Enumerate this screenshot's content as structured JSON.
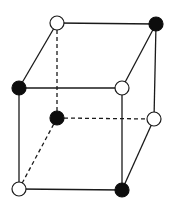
{
  "diagram": {
    "type": "cube-lattice",
    "colors": {
      "filled": "#0d0d0d",
      "open": "#ffffff",
      "line": "#1a1a1a",
      "background": "#ffffff"
    },
    "vertices": [
      {
        "id": "back-top-left",
        "x": 57,
        "y": 23,
        "kind": "open"
      },
      {
        "id": "back-top-right",
        "x": 156,
        "y": 24,
        "kind": "filled"
      },
      {
        "id": "front-top-left",
        "x": 19,
        "y": 88,
        "kind": "filled"
      },
      {
        "id": "front-top-right",
        "x": 122,
        "y": 88,
        "kind": "open"
      },
      {
        "id": "back-bottom-left",
        "x": 57,
        "y": 118,
        "kind": "filled"
      },
      {
        "id": "back-bottom-right",
        "x": 154,
        "y": 119,
        "kind": "open"
      },
      {
        "id": "front-bottom-left",
        "x": 19,
        "y": 189,
        "kind": "open"
      },
      {
        "id": "front-bottom-right",
        "x": 122,
        "y": 190,
        "kind": "filled"
      }
    ],
    "edges": [
      {
        "from": "back-top-left",
        "to": "back-top-right",
        "style": "solid"
      },
      {
        "from": "back-top-left",
        "to": "front-top-left",
        "style": "solid"
      },
      {
        "from": "back-top-right",
        "to": "front-top-right",
        "style": "solid"
      },
      {
        "from": "back-top-right",
        "to": "back-bottom-right",
        "style": "solid"
      },
      {
        "from": "front-top-left",
        "to": "front-top-right",
        "style": "solid"
      },
      {
        "from": "front-top-left",
        "to": "front-bottom-left",
        "style": "solid"
      },
      {
        "from": "front-top-right",
        "to": "front-bottom-right",
        "style": "solid"
      },
      {
        "from": "front-bottom-left",
        "to": "front-bottom-right",
        "style": "solid"
      },
      {
        "from": "back-bottom-right",
        "to": "front-bottom-right",
        "style": "solid"
      },
      {
        "from": "back-top-left",
        "to": "back-bottom-left",
        "style": "dashed"
      },
      {
        "from": "back-bottom-left",
        "to": "back-bottom-right",
        "style": "dashed"
      },
      {
        "from": "back-bottom-left",
        "to": "front-bottom-left",
        "style": "dashed"
      }
    ],
    "vertex_radius": 7
  }
}
